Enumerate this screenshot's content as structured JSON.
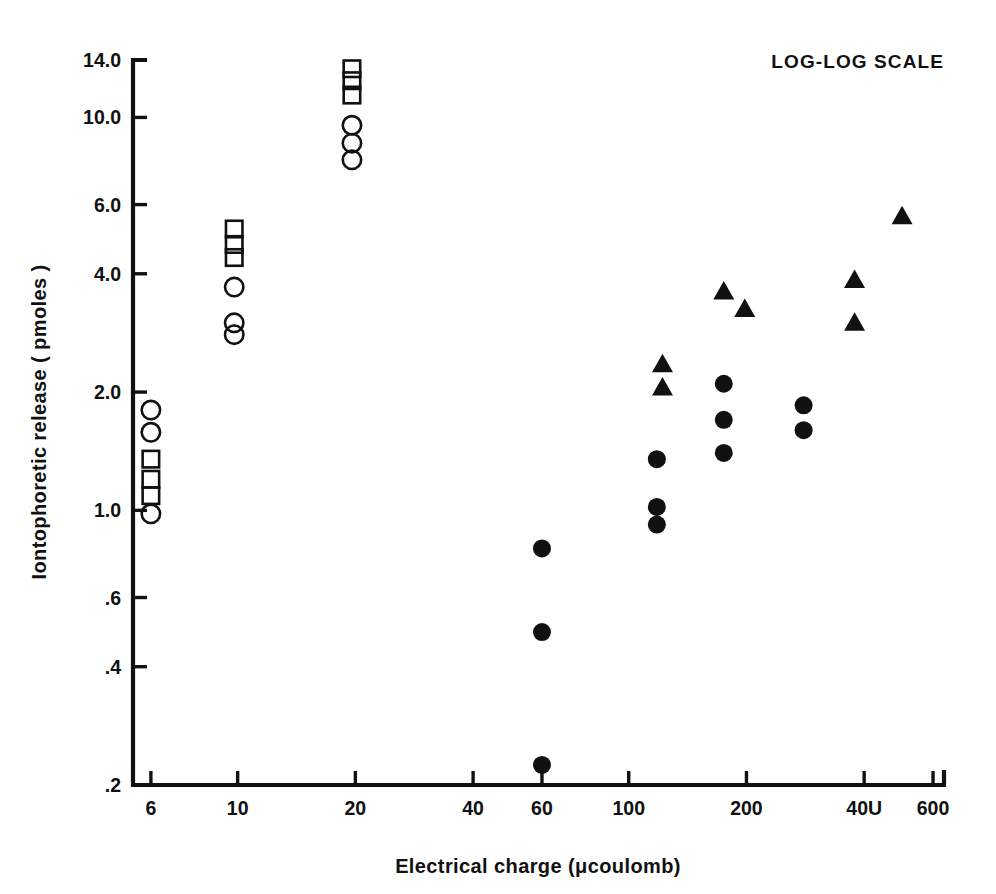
{
  "figure": {
    "annotation": "LOG-LOG SCALE",
    "background_color": "#ffffff",
    "ink_color": "#111111"
  },
  "chart_data": {
    "type": "scatter",
    "title": "",
    "annotation": "LOG-LOG SCALE",
    "xlabel": "Electrical  charge  (μcoulomb)",
    "ylabel": "Iontophoretic  release  ( pmoles )",
    "xscale": "log",
    "yscale": "log",
    "xlim": [
      5.4,
      640
    ],
    "ylim": [
      0.2,
      14.0
    ],
    "grid": false,
    "legend_position": "none",
    "xticks": [
      6,
      10,
      20,
      40,
      60,
      100,
      200,
      400,
      600
    ],
    "xtick_labels": [
      "6",
      "10",
      "20",
      "40",
      "60",
      "100",
      "200",
      "40U",
      "600"
    ],
    "yticks": [
      0.2,
      0.4,
      0.6,
      1.0,
      2.0,
      4.0,
      6.0,
      10.0,
      14.0
    ],
    "ytick_labels": [
      ".2",
      ".4",
      ".6",
      "1.0",
      "2.0",
      "4.0",
      "6.0",
      "10.0",
      "14.0"
    ],
    "series": [
      {
        "name": "open-circle",
        "marker": "circle-open",
        "points": [
          [
            6.0,
            1.8
          ],
          [
            6.0,
            1.58
          ],
          [
            6.0,
            0.98
          ],
          [
            9.8,
            3.7
          ],
          [
            9.8,
            3.0
          ],
          [
            9.8,
            2.8
          ],
          [
            19.6,
            9.55
          ],
          [
            19.6,
            8.6
          ],
          [
            19.6,
            7.8
          ]
        ]
      },
      {
        "name": "open-square",
        "marker": "square-open",
        "points": [
          [
            6.0,
            1.35
          ],
          [
            6.0,
            1.2
          ],
          [
            6.0,
            1.09
          ],
          [
            9.8,
            5.2
          ],
          [
            9.8,
            4.75
          ],
          [
            9.8,
            4.4
          ],
          [
            19.6,
            13.3
          ],
          [
            19.6,
            12.4
          ],
          [
            19.6,
            11.4
          ]
        ]
      },
      {
        "name": "filled-circle",
        "marker": "circle-filled",
        "points": [
          [
            60.0,
            0.8
          ],
          [
            60.0,
            0.49
          ],
          [
            60.0,
            0.225
          ],
          [
            118.0,
            1.35
          ],
          [
            118.0,
            1.02
          ],
          [
            118.0,
            0.92
          ],
          [
            175.0,
            2.1
          ],
          [
            175.0,
            1.7
          ],
          [
            175.0,
            1.4
          ],
          [
            280.0,
            1.85
          ],
          [
            280.0,
            1.6
          ]
        ]
      },
      {
        "name": "filled-triangle",
        "marker": "triangle-filled",
        "points": [
          [
            122.0,
            2.35
          ],
          [
            122.0,
            2.05
          ],
          [
            175.0,
            3.6
          ],
          [
            198.0,
            3.25
          ],
          [
            378.0,
            3.85
          ],
          [
            378.0,
            3.0
          ],
          [
            500.0,
            5.6
          ]
        ]
      }
    ]
  }
}
